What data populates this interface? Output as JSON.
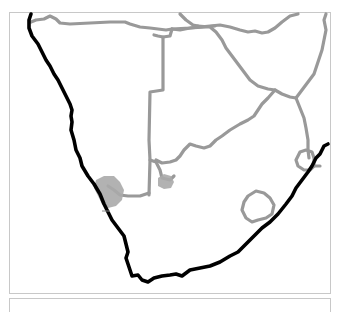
{
  "map": {
    "region": "Southern Africa",
    "colors": {
      "background": "#ffffff",
      "frame": "#c8c8c8",
      "coastline": "#000000",
      "internal_borders": "#999999",
      "highlight_areas": "#aaaaaa"
    },
    "layers": [
      {
        "name": "coastline",
        "style": "thick black line"
      },
      {
        "name": "country-borders",
        "style": "gray lines"
      },
      {
        "name": "highlighted-areas",
        "style": "gray filled blobs",
        "count": 2
      }
    ]
  }
}
